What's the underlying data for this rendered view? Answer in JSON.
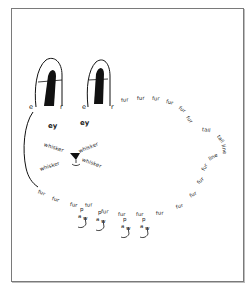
{
  "artwork": {
    "type": "concrete-poem-drawing",
    "subject": "rabbit",
    "ears": [
      {
        "left_letter": "e",
        "right_letter": "r"
      },
      {
        "left_letter": "e",
        "right_letter": "r"
      }
    ],
    "eyes": [
      "ey",
      "ey"
    ],
    "whiskers": [
      "whisker",
      "whisker",
      "whisker",
      "whisker"
    ],
    "fur_top": [
      "fur",
      "fur",
      "fur",
      "fur",
      "fur",
      "fur"
    ],
    "tail": [
      "tail",
      "tail"
    ],
    "back_line": [
      "line",
      "line"
    ],
    "fur_bottom": [
      "fur",
      "fur",
      "fur",
      "fur",
      "fur",
      "fur",
      "fur",
      "fur",
      "fur",
      "fur",
      "fur",
      "fur",
      "fur"
    ],
    "paws": [
      {
        "p": "p",
        "a": "a",
        "w": "w"
      },
      {
        "p": "p",
        "a": "a",
        "w": "w"
      },
      {
        "p": "p",
        "a": "a",
        "w": "w"
      },
      {
        "p": "p",
        "a": "a",
        "w": "w"
      }
    ],
    "colors": {
      "ink": "#111111",
      "frame": "#7a7a7a",
      "background": "#ffffff"
    }
  }
}
